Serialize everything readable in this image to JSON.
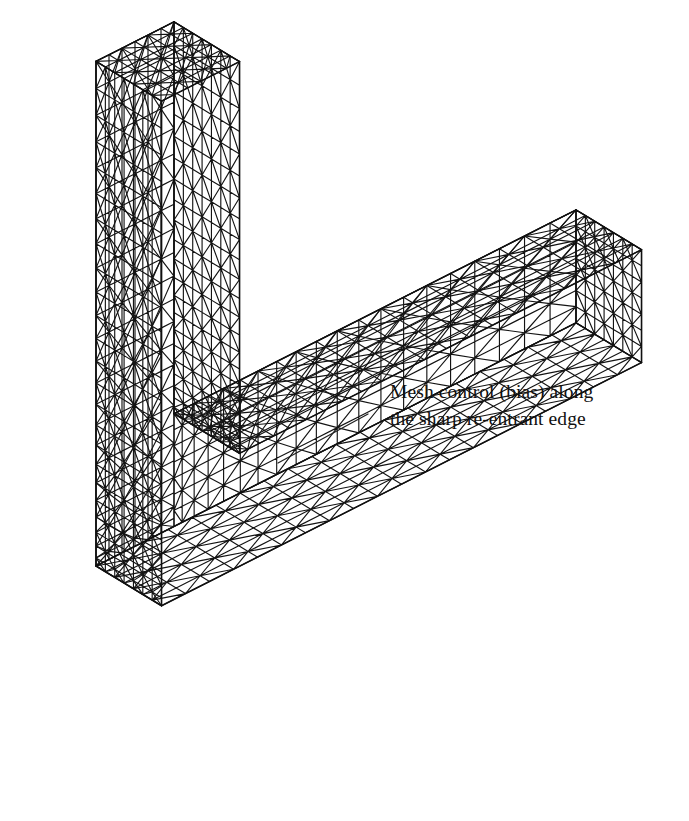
{
  "figure": {
    "background_color": "#ffffff",
    "mesh_line_color": "#141414",
    "leader_line_color": "#222222",
    "text_color": "#111111"
  },
  "annotation": {
    "line1": "Mesh control (bias) along",
    "line2": "the sharp re-entrant edge",
    "text_x": 390,
    "text_y1": 378,
    "text_y2": 405,
    "leader": {
      "x1": 278,
      "y1": 463,
      "x2": 368,
      "y2": 414
    }
  },
  "geometry": {
    "shape": "L-bracket",
    "projection": "isometric",
    "vertical_leg": {
      "top_face_corners": [
        [
          153,
          41
        ],
        [
          234,
          73
        ],
        [
          120,
          150
        ],
        [
          34,
          110
        ]
      ],
      "front_bottom": [
        272,
        465
      ],
      "left_bottom": [
        96,
        566
      ]
    },
    "horizontal_leg": {
      "end_face_right": 578,
      "front_bottom_tip": [
        415,
        745
      ],
      "top_inner_corner": [
        272,
        465
      ]
    },
    "mesh": {
      "element_type": "triangle",
      "refinement_region": "sharp re-entrant edge",
      "bias": "graded toward re-entrant edge"
    }
  }
}
